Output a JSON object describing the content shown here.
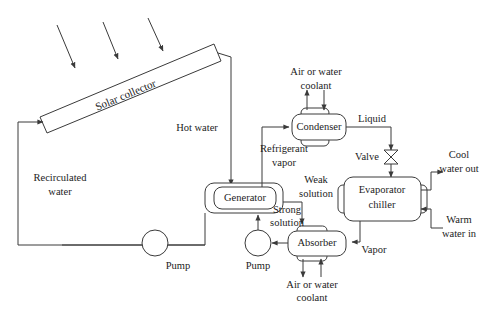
{
  "diagram": {
    "line_color": "#3a3a3a",
    "text_color": "#1c1c1c",
    "background": "#ffffff"
  },
  "components": {
    "solar_collector": "Solar collector",
    "condenser": "Condenser",
    "generator": "Generator",
    "absorber": "Absorber",
    "evaporator_line1": "Evaporator",
    "evaporator_line2": "chiller",
    "valve": "Valve",
    "pump_water": "Pump",
    "pump_solution": "Pump"
  },
  "stream_labels": {
    "hot_water": "Hot water",
    "recirculated_line1": "Recirculated",
    "recirculated_line2": "water",
    "refrigerant_line1": "Refrigerant",
    "refrigerant_line2": "vapor",
    "weak_line1": "Weak",
    "weak_line2": "solution",
    "strong_line1": "Strong",
    "strong_line2": "solution",
    "liquid": "Liquid",
    "vapor": "Vapor",
    "condenser_coolant_line1": "Air or water",
    "condenser_coolant_line2": "coolant",
    "absorber_coolant_line1": "Air or water",
    "absorber_coolant_line2": "coolant",
    "cool_water_line1": "Cool",
    "cool_water_line2": "water out",
    "warm_water_line1": "Warm",
    "warm_water_line2": "water in"
  },
  "icons": {
    "sun_ray_1": "sun-ray-arrow-icon",
    "sun_ray_2": "sun-ray-arrow-icon",
    "sun_ray_3": "sun-ray-arrow-icon",
    "valve_symbol": "bowtie-valve-icon",
    "pump_symbol": "pump-circle-icon"
  }
}
